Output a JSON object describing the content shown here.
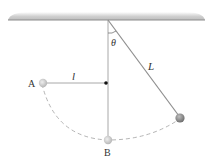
{
  "diagram": {
    "labels": {
      "theta": "θ",
      "length_L": "L",
      "length_l": "l",
      "point_A": "A",
      "point_B": "B"
    },
    "colors": {
      "ceiling": "#c8c8c8",
      "string": "#9a9a9a",
      "bob_light": "#d0d0d0",
      "bob_dark": "#8a8a8a",
      "dashed_arc": "#b5b5b5",
      "peg": "#111111"
    }
  }
}
